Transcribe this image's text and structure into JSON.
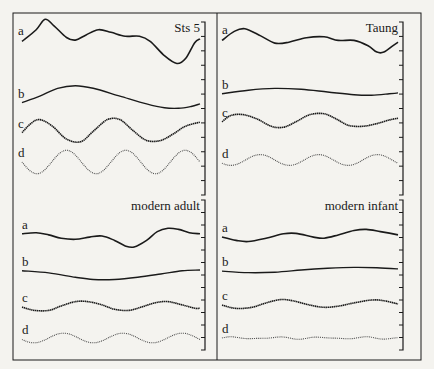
{
  "figure": {
    "panels": [
      {
        "id": "sts5",
        "title": "Sts 5",
        "curves": [
          {
            "label": "a",
            "style": "solid-thick",
            "points": [
              [
                0,
                0.1
              ],
              [
                0.08,
                0.55
              ],
              [
                0.13,
                0.95
              ],
              [
                0.18,
                0.7
              ],
              [
                0.25,
                0.25
              ],
              [
                0.3,
                0.15
              ],
              [
                0.36,
                0.35
              ],
              [
                0.43,
                0.55
              ],
              [
                0.5,
                0.45
              ],
              [
                0.58,
                0.3
              ],
              [
                0.66,
                0.3
              ],
              [
                0.72,
                0.1
              ],
              [
                0.8,
                -0.45
              ],
              [
                0.87,
                -0.75
              ],
              [
                0.92,
                -0.55
              ],
              [
                0.97,
                0.05
              ],
              [
                1.0,
                0.2
              ]
            ]
          },
          {
            "label": "b",
            "style": "solid",
            "points": [
              [
                0,
                -0.1
              ],
              [
                0.1,
                0.15
              ],
              [
                0.2,
                0.45
              ],
              [
                0.3,
                0.55
              ],
              [
                0.4,
                0.45
              ],
              [
                0.55,
                0.15
              ],
              [
                0.7,
                -0.15
              ],
              [
                0.8,
                -0.3
              ],
              [
                0.88,
                -0.32
              ],
              [
                0.95,
                -0.25
              ],
              [
                1.0,
                -0.15
              ]
            ]
          },
          {
            "label": "c",
            "style": "dense-dotted",
            "points": [
              [
                0,
                -0.1
              ],
              [
                0.05,
                0.25
              ],
              [
                0.1,
                0.4
              ],
              [
                0.17,
                0.15
              ],
              [
                0.25,
                -0.35
              ],
              [
                0.33,
                -0.45
              ],
              [
                0.4,
                -0.05
              ],
              [
                0.48,
                0.4
              ],
              [
                0.55,
                0.4
              ],
              [
                0.62,
                0.0
              ],
              [
                0.7,
                -0.4
              ],
              [
                0.78,
                -0.4
              ],
              [
                0.85,
                -0.15
              ],
              [
                0.92,
                0.15
              ],
              [
                1.0,
                0.3
              ]
            ]
          },
          {
            "label": "d",
            "style": "dotted",
            "cycles": 3.0,
            "amp": 0.45,
            "phase": 0.5
          }
        ]
      },
      {
        "id": "taung",
        "title": "Taung",
        "curves": [
          {
            "label": "a",
            "style": "solid-thick",
            "points": [
              [
                0,
                0.2
              ],
              [
                0.07,
                0.7
              ],
              [
                0.13,
                0.85
              ],
              [
                0.22,
                0.45
              ],
              [
                0.3,
                0.05
              ],
              [
                0.38,
                0.1
              ],
              [
                0.48,
                0.35
              ],
              [
                0.58,
                0.4
              ],
              [
                0.66,
                0.2
              ],
              [
                0.75,
                0.2
              ],
              [
                0.83,
                -0.1
              ],
              [
                0.88,
                -0.45
              ],
              [
                0.92,
                -0.45
              ],
              [
                0.97,
                -0.1
              ],
              [
                1.0,
                0.1
              ]
            ]
          },
          {
            "label": "b",
            "style": "solid",
            "points": [
              [
                0,
                -0.1
              ],
              [
                0.15,
                0.1
              ],
              [
                0.3,
                0.2
              ],
              [
                0.45,
                0.15
              ],
              [
                0.6,
                0.0
              ],
              [
                0.75,
                -0.15
              ],
              [
                0.85,
                -0.18
              ],
              [
                0.95,
                -0.1
              ],
              [
                1.0,
                -0.05
              ]
            ]
          },
          {
            "label": "c",
            "style": "dense-dotted",
            "points": [
              [
                0,
                -0.1
              ],
              [
                0.05,
                0.25
              ],
              [
                0.12,
                0.3
              ],
              [
                0.2,
                0.05
              ],
              [
                0.28,
                -0.35
              ],
              [
                0.35,
                -0.4
              ],
              [
                0.42,
                -0.1
              ],
              [
                0.5,
                0.3
              ],
              [
                0.58,
                0.35
              ],
              [
                0.65,
                0.05
              ],
              [
                0.72,
                -0.3
              ],
              [
                0.8,
                -0.35
              ],
              [
                0.88,
                -0.2
              ],
              [
                0.95,
                0.0
              ],
              [
                1.0,
                0.1
              ]
            ]
          },
          {
            "label": "d",
            "style": "dotted",
            "cycles": 3.0,
            "amp": 0.3,
            "phase": 0.6
          }
        ]
      },
      {
        "id": "modern-adult",
        "title": "modern adult",
        "curves": [
          {
            "label": "a",
            "style": "solid-thick",
            "points": [
              [
                0,
                0.1
              ],
              [
                0.08,
                0.15
              ],
              [
                0.15,
                0.05
              ],
              [
                0.22,
                -0.1
              ],
              [
                0.3,
                -0.15
              ],
              [
                0.38,
                -0.05
              ],
              [
                0.45,
                0.0
              ],
              [
                0.52,
                -0.2
              ],
              [
                0.58,
                -0.45
              ],
              [
                0.63,
                -0.5
              ],
              [
                0.7,
                -0.2
              ],
              [
                0.76,
                0.2
              ],
              [
                0.82,
                0.35
              ],
              [
                0.88,
                0.3
              ],
              [
                0.94,
                0.15
              ],
              [
                1.0,
                0.1
              ]
            ]
          },
          {
            "label": "b",
            "style": "solid",
            "points": [
              [
                0,
                0.15
              ],
              [
                0.15,
                0.05
              ],
              [
                0.3,
                -0.15
              ],
              [
                0.4,
                -0.25
              ],
              [
                0.52,
                -0.25
              ],
              [
                0.65,
                -0.15
              ],
              [
                0.78,
                0.0
              ],
              [
                0.9,
                0.15
              ],
              [
                1.0,
                0.18
              ]
            ]
          },
          {
            "label": "c",
            "style": "dense-dotted",
            "points": [
              [
                0,
                -0.05
              ],
              [
                0.07,
                -0.2
              ],
              [
                0.15,
                -0.2
              ],
              [
                0.22,
                0.0
              ],
              [
                0.3,
                0.2
              ],
              [
                0.37,
                0.2
              ],
              [
                0.45,
                0.05
              ],
              [
                0.52,
                -0.15
              ],
              [
                0.6,
                -0.2
              ],
              [
                0.67,
                -0.05
              ],
              [
                0.75,
                0.15
              ],
              [
                0.82,
                0.2
              ],
              [
                0.9,
                0.05
              ],
              [
                0.97,
                -0.1
              ],
              [
                1.0,
                -0.1
              ]
            ]
          },
          {
            "label": "d",
            "style": "dotted",
            "cycles": 3.0,
            "amp": 0.22,
            "phase": 0.55
          }
        ]
      },
      {
        "id": "modern-infant",
        "title": "modern infant",
        "curves": [
          {
            "label": "a",
            "style": "solid-thick",
            "points": [
              [
                0,
                -0.05
              ],
              [
                0.08,
                -0.2
              ],
              [
                0.15,
                -0.25
              ],
              [
                0.25,
                -0.1
              ],
              [
                0.35,
                0.1
              ],
              [
                0.42,
                0.12
              ],
              [
                0.52,
                -0.05
              ],
              [
                0.58,
                -0.1
              ],
              [
                0.66,
                0.05
              ],
              [
                0.75,
                0.25
              ],
              [
                0.82,
                0.3
              ],
              [
                0.9,
                0.2
              ],
              [
                1.0,
                0.05
              ]
            ]
          },
          {
            "label": "b",
            "style": "solid",
            "points": [
              [
                0,
                -0.05
              ],
              [
                0.15,
                -0.12
              ],
              [
                0.3,
                -0.1
              ],
              [
                0.45,
                0.0
              ],
              [
                0.6,
                0.08
              ],
              [
                0.75,
                0.12
              ],
              [
                0.88,
                0.1
              ],
              [
                1.0,
                0.05
              ]
            ]
          },
          {
            "label": "c",
            "style": "dense-dotted",
            "points": [
              [
                0,
                -0.05
              ],
              [
                0.08,
                -0.2
              ],
              [
                0.17,
                -0.15
              ],
              [
                0.25,
                0.05
              ],
              [
                0.33,
                0.2
              ],
              [
                0.4,
                0.15
              ],
              [
                0.5,
                -0.05
              ],
              [
                0.58,
                -0.15
              ],
              [
                0.66,
                -0.1
              ],
              [
                0.75,
                0.05
              ],
              [
                0.85,
                0.18
              ],
              [
                0.92,
                0.15
              ],
              [
                1.0,
                0.0
              ]
            ]
          },
          {
            "label": "d",
            "style": "dotted-flat",
            "cycles": 4.0,
            "amp": 0.04,
            "phase": 0.0
          }
        ]
      }
    ]
  },
  "chart_data": {
    "type": "line",
    "title": "",
    "xlabel": "",
    "ylabel": "",
    "grid": false,
    "panels": [
      "Sts 5",
      "Taung",
      "modern adult",
      "modern infant"
    ],
    "series_labels": [
      "a",
      "b",
      "c",
      "d"
    ],
    "note": "Four panels, each with four stacked curves a–d (normalized shapes, no numeric axes); right edge of each panel carries unlabeled tick marks"
  }
}
